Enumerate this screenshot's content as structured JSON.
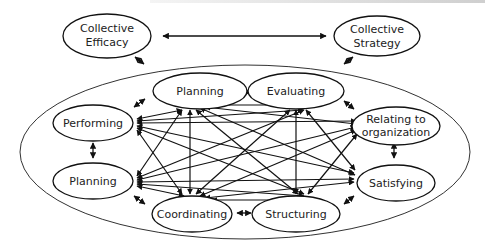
{
  "diagram": {
    "type": "network-of-processes",
    "outer_nodes": [
      {
        "id": "collective-efficacy",
        "lines": [
          "Collective",
          "Efficacy"
        ]
      },
      {
        "id": "collective-strategy",
        "lines": [
          "Collective",
          "Strategy"
        ]
      }
    ],
    "inner_nodes": [
      {
        "id": "planning-top",
        "lines": [
          "Planning"
        ]
      },
      {
        "id": "evaluating",
        "lines": [
          "Evaluating"
        ]
      },
      {
        "id": "performing",
        "lines": [
          "Performing"
        ]
      },
      {
        "id": "relating-to-organization",
        "lines": [
          "Relating to",
          "organization"
        ]
      },
      {
        "id": "planning-left",
        "lines": [
          "Planning"
        ]
      },
      {
        "id": "satisfying",
        "lines": [
          "Satisfying"
        ]
      },
      {
        "id": "coordinating",
        "lines": [
          "Coordinating"
        ]
      },
      {
        "id": "structuring",
        "lines": [
          "Structuring"
        ]
      }
    ],
    "relations": [
      {
        "from": "collective-efficacy",
        "to": "collective-strategy",
        "type": "bidirectional"
      },
      {
        "from": "collective-efficacy",
        "to": "inner-system",
        "type": "bidirectional"
      },
      {
        "from": "collective-strategy",
        "to": "inner-system",
        "type": "bidirectional"
      },
      {
        "note": "all inner nodes mutually connected with arrows; adjacent nodes linked by short double-headed arrows"
      }
    ]
  }
}
